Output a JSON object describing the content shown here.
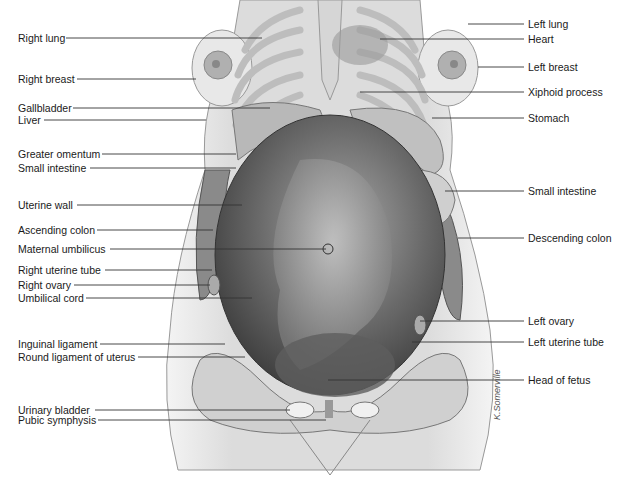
{
  "figure": {
    "signature": "K.Somerville"
  },
  "labels_left": [
    {
      "text": "Right lung",
      "y": 38,
      "x2": 262
    },
    {
      "text": "Right breast",
      "y": 79,
      "x2": 196
    },
    {
      "text": "Gallbladder",
      "y": 108,
      "x2": 270
    },
    {
      "text": "Liver",
      "y": 120,
      "x2": 206
    },
    {
      "text": "Greater omentum",
      "y": 154,
      "x2": 236
    },
    {
      "text": "Small intestine",
      "y": 168,
      "x2": 236
    },
    {
      "text": "Uterine wall",
      "y": 205,
      "x2": 242
    },
    {
      "text": "Ascending colon",
      "y": 230,
      "x2": 213
    },
    {
      "text": "Maternal umbilicus",
      "y": 249,
      "x2": 326
    },
    {
      "text": "Right uterine tube",
      "y": 270,
      "x2": 212
    },
    {
      "text": "Right ovary",
      "y": 285,
      "x2": 210
    },
    {
      "text": "Umbilical cord",
      "y": 298,
      "x2": 252
    },
    {
      "text": "Inguinal ligament",
      "y": 344,
      "x2": 225
    },
    {
      "text": "Round ligament of uterus",
      "y": 357,
      "x2": 245
    },
    {
      "text": "Urinary bladder",
      "y": 410,
      "x2": 290
    },
    {
      "text": "Pubic symphysis",
      "y": 420,
      "x2": 326
    }
  ],
  "labels_right": [
    {
      "text": "Left lung",
      "y": 24,
      "x1": 468
    },
    {
      "text": "Heart",
      "y": 39,
      "x1": 380
    },
    {
      "text": "Left breast",
      "y": 67,
      "x1": 478
    },
    {
      "text": "Xiphoid process",
      "y": 92,
      "x1": 360
    },
    {
      "text": "Stomach",
      "y": 118,
      "x1": 432
    },
    {
      "text": "Small intestine",
      "y": 191,
      "x1": 445
    },
    {
      "text": "Descending colon",
      "y": 238,
      "x1": 458
    },
    {
      "text": "Left ovary",
      "y": 321,
      "x1": 420
    },
    {
      "text": "Left uterine tube",
      "y": 342,
      "x1": 412
    },
    {
      "text": "Head of fetus",
      "y": 380,
      "x1": 328
    }
  ],
  "colors": {
    "text": "#1a1a1a",
    "leader_line": "#333333",
    "skin": "#e2e2e2",
    "uterus": "#6f6f6f",
    "ribs": "#c8c8c8"
  }
}
